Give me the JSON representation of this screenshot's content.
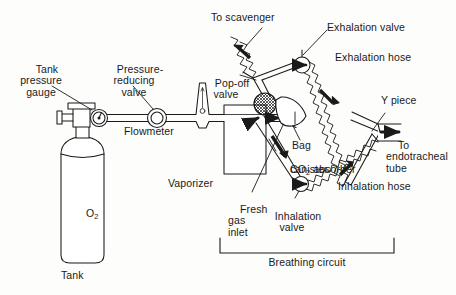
{
  "figure": {
    "background_color": "#fdfdfb",
    "ink_color": "#1a1a1a"
  },
  "labels": {
    "tank_pressure_gauge": "Tank\npressure\ngauge",
    "pressure_reducing_valve": "Pressure-\nreducing\nvalve",
    "flowmeter": "Flowmeter",
    "vaporizer": "Vaporizer",
    "tank": "Tank",
    "tank_contents": "O",
    "tank_contents_sub": "2",
    "to_scavenger": "To scavenger",
    "pop_off_valve": "Pop-off\nvalve",
    "exhalation_valve": "Exhalation valve",
    "exhalation_hose": "Exhalation hose",
    "y_piece": "Y piece",
    "bag": "Bag",
    "co2_absorber_prefix": "CO",
    "co2_absorber_sub": "2",
    "co2_absorber_suffix": " absorber",
    "co2_absorber_line2": "canister",
    "to_endotracheal_tube": "To\nendotracheal\ntube",
    "inhalation_hose": "Inhalation hose",
    "inhalation_valve": "Inhalation\nvalve",
    "fresh_gas_inlet": "Fresh\ngas\ninlet",
    "breathing_circuit": "Breathing circuit"
  },
  "components": [
    {
      "name": "oxygen-tank",
      "label": "Tank",
      "contents": "O2"
    },
    {
      "name": "tank-pressure-gauge",
      "label": "Tank pressure gauge"
    },
    {
      "name": "pressure-reducing-valve",
      "label": "Pressure-reducing valve"
    },
    {
      "name": "flowmeter",
      "label": "Flowmeter"
    },
    {
      "name": "vaporizer",
      "label": "Vaporizer"
    },
    {
      "name": "fresh-gas-inlet",
      "label": "Fresh gas inlet"
    },
    {
      "name": "pop-off-valve",
      "label": "Pop-off valve"
    },
    {
      "name": "scavenger-hose",
      "label": "To scavenger"
    },
    {
      "name": "exhalation-valve",
      "label": "Exhalation valve"
    },
    {
      "name": "exhalation-hose",
      "label": "Exhalation hose"
    },
    {
      "name": "reservoir-bag",
      "label": "Bag"
    },
    {
      "name": "co2-absorber-canister",
      "label": "CO2 absorber canister"
    },
    {
      "name": "inhalation-valve",
      "label": "Inhalation valve"
    },
    {
      "name": "inhalation-hose",
      "label": "Inhalation hose"
    },
    {
      "name": "y-piece",
      "label": "Y piece"
    },
    {
      "name": "endotracheal-tube-outlet",
      "label": "To endotracheal tube"
    },
    {
      "name": "breathing-circuit-bracket",
      "label": "Breathing circuit"
    }
  ]
}
